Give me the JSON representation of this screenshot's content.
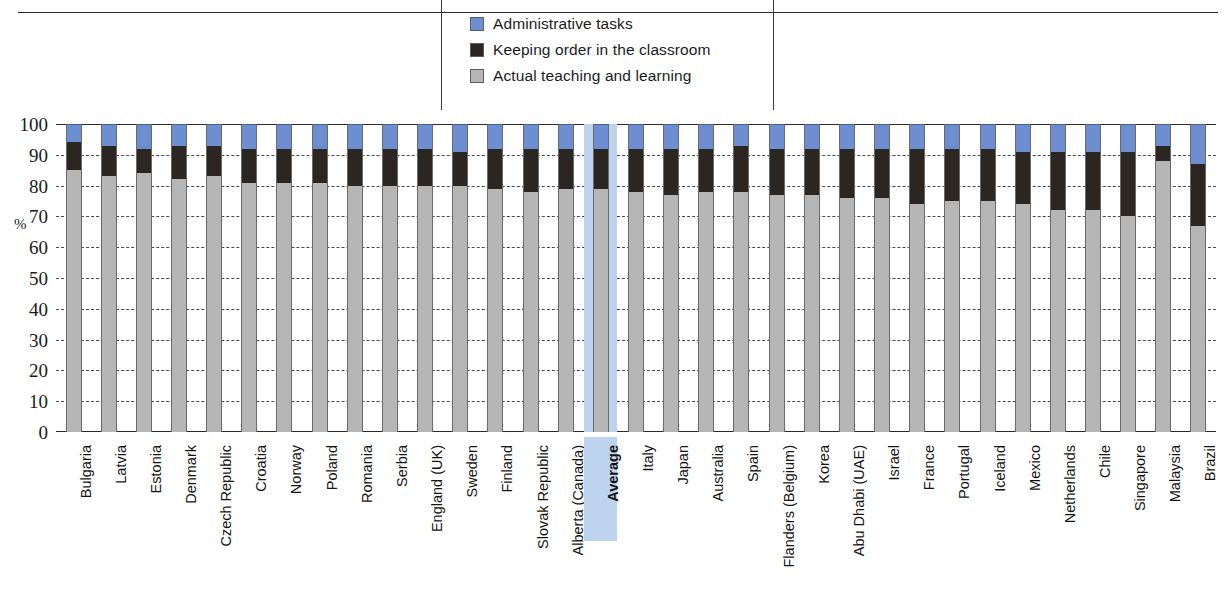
{
  "figure": {
    "title_fragment": "",
    "percent_symbol": "%"
  },
  "legend": {
    "items": [
      {
        "label": "Administrative tasks",
        "color": "#6d8fd1",
        "key": "administrative"
      },
      {
        "label": "Keeping order in the classroom",
        "color": "#2b2622",
        "key": "keeping_order"
      },
      {
        "label": "Actual teaching and learning",
        "color": "#b6b6b6",
        "key": "teaching"
      }
    ]
  },
  "yaxis": {
    "unit": "%",
    "ticks": [
      "100",
      "90",
      "80",
      "70",
      "60",
      "50",
      "40",
      "30",
      "20",
      "10",
      "0"
    ],
    "min": 0,
    "max": 100,
    "step": 10
  },
  "highlight": {
    "category": "Average",
    "color": "#bed4ee"
  },
  "chart_data": {
    "type": "bar",
    "stacked": true,
    "title": "",
    "subtitle": "",
    "xlabel": "",
    "ylabel": "%",
    "ylim": [
      0,
      100
    ],
    "grid": true,
    "legend_position": "top-center",
    "categories": [
      "Bulgaria",
      "Latvia",
      "Estonia",
      "Denmark",
      "Czech Republic",
      "Croatia",
      "Norway",
      "Poland",
      "Romania",
      "Serbia",
      "England (UK)",
      "Sweden",
      "Finland",
      "Slovak Republic",
      "Alberta (Canada)",
      "Average",
      "Italy",
      "Japan",
      "Australia",
      "Spain",
      "Flanders (Belgium)",
      "Korea",
      "Abu Dhabi (UAE)",
      "Israel",
      "France",
      "Portugal",
      "Iceland",
      "Mexico",
      "Netherlands",
      "Chile",
      "Singapore",
      "Malaysia",
      "Brazil"
    ],
    "series": [
      {
        "name": "Actual teaching and learning",
        "color": "#b6b6b6",
        "values": [
          85,
          83,
          84,
          82,
          83,
          81,
          81,
          81,
          80,
          80,
          80,
          80,
          79,
          78,
          79,
          79,
          78,
          77,
          78,
          78,
          77,
          77,
          76,
          76,
          74,
          75,
          75,
          74,
          72,
          72,
          70,
          88,
          67
        ]
      },
      {
        "name": "Keeping order in the classroom",
        "color": "#2b2622",
        "values": [
          9,
          10,
          8,
          11,
          10,
          11,
          11,
          11,
          12,
          12,
          12,
          11,
          13,
          14,
          13,
          13,
          14,
          15,
          14,
          15,
          15,
          15,
          16,
          16,
          18,
          17,
          17,
          17,
          19,
          19,
          21,
          5,
          20
        ]
      },
      {
        "name": "Administrative tasks",
        "color": "#6d8fd1",
        "values": [
          6,
          7,
          8,
          7,
          7,
          8,
          8,
          8,
          8,
          8,
          8,
          9,
          8,
          8,
          8,
          8,
          8,
          8,
          8,
          7,
          8,
          8,
          8,
          8,
          8,
          8,
          8,
          9,
          9,
          9,
          9,
          7,
          13
        ]
      }
    ]
  }
}
